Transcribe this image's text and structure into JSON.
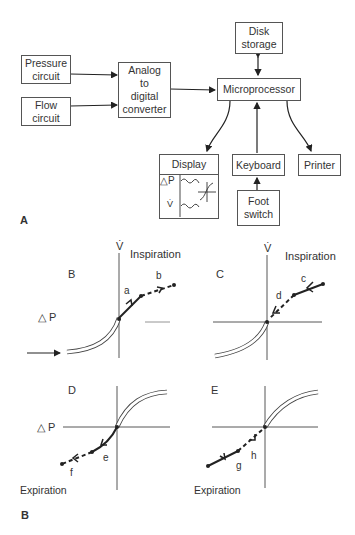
{
  "part_a": {
    "label": "A",
    "blocks": {
      "pressure": "Pressure\ncircuit",
      "flow": "Flow\ncircuit",
      "adc": "Analog\nto\ndigital\nconverter",
      "micro": "Microprocessor",
      "disk": "Disk\nstorage",
      "display": "Display",
      "keyboard": "Keyboard",
      "printer": "Printer",
      "foot": "Foot\nswitch"
    },
    "display_panel": {
      "pressure_symbol": "△P",
      "flow_symbol": "V̇"
    }
  },
  "part_b": {
    "label": "B",
    "panels": {
      "B": {
        "label": "B",
        "y_axis": "V̇",
        "region": "Inspiration",
        "x_axis": "△ P",
        "segments": [
          "a",
          "b"
        ]
      },
      "C": {
        "label": "C",
        "y_axis": "V̇",
        "region": "Inspiration",
        "segments": [
          "c",
          "d"
        ]
      },
      "D": {
        "label": "D",
        "x_axis": "△ P",
        "region": "Expiration",
        "segments": [
          "e",
          "f"
        ]
      },
      "E": {
        "label": "E",
        "region": "Expiration",
        "segments": [
          "g",
          "h"
        ]
      }
    }
  }
}
